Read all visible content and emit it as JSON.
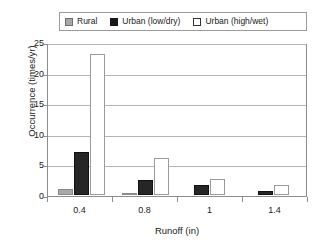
{
  "chart_data": {
    "type": "bar",
    "title": "",
    "xlabel": "Runoff (in)",
    "ylabel": "Occurrence (times/yr)",
    "categories": [
      "0.4",
      "0.8",
      "1",
      "1.4"
    ],
    "ylim": [
      0,
      25
    ],
    "yticks": [
      "0",
      "5",
      "10",
      "15",
      "20",
      "25"
    ],
    "grid": true,
    "legend_position": "top",
    "series": [
      {
        "name": "Rural",
        "color": "#a8a8a8",
        "values": [
          1.0,
          0.3,
          0,
          0
        ]
      },
      {
        "name": "Urban (low/dry)",
        "color": "#171717",
        "values": [
          7.0,
          2.5,
          1.6,
          0.7
        ]
      },
      {
        "name": "Urban (high/wet)",
        "color": "#ffffff",
        "values": [
          23.0,
          6.0,
          2.6,
          1.7
        ]
      }
    ]
  },
  "legend": {
    "entries": [
      {
        "label": "Rural",
        "swatch": "rural"
      },
      {
        "label": "Urban (low/dry)",
        "swatch": "lowdry"
      },
      {
        "label": "Urban (high/wet)",
        "swatch": "highwet"
      }
    ]
  },
  "axes": {
    "y_title": "Occurrence (times/yr)",
    "x_title": "Runoff (in)",
    "y_ticks": [
      "25",
      "20",
      "15",
      "10",
      "5",
      "0"
    ],
    "x_ticks": [
      "0.4",
      "0.8",
      "1",
      "1.4"
    ]
  }
}
